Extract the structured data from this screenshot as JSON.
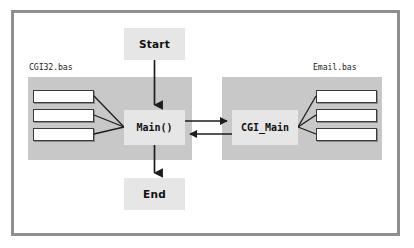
{
  "figure": {
    "type": "flow-diagram",
    "frame_border_color": "#8e8f91",
    "background_color": "#ffffff"
  },
  "modules": [
    {
      "id": "cgi32",
      "label": "CGI32.bas",
      "panel_color": "#c8c8c8",
      "routine_boxes": [
        "",
        "",
        ""
      ],
      "routine_count": 3
    },
    {
      "id": "email",
      "label": "Email.bas",
      "panel_color": "#c8c8c8",
      "routine_boxes": [
        "",
        "",
        ""
      ],
      "routine_count": 3
    }
  ],
  "nodes": [
    {
      "id": "start",
      "label": "Start",
      "shape": "terminator",
      "fill": "#e6e6e6",
      "bold": true,
      "mono": false
    },
    {
      "id": "main",
      "label": "Main()",
      "shape": "process",
      "fill": "#e6e6e6",
      "bold": true,
      "mono": true
    },
    {
      "id": "cgi_main",
      "label": "CGI_Main",
      "shape": "process",
      "fill": "#e6e6e6",
      "bold": true,
      "mono": true
    },
    {
      "id": "end",
      "label": "End",
      "shape": "terminator",
      "fill": "#e6e6e6",
      "bold": true,
      "mono": false
    }
  ],
  "connectors": [
    {
      "from": "start",
      "to": "main",
      "direction": "down",
      "arrowhead": true
    },
    {
      "from": "main",
      "to": "end",
      "direction": "down",
      "arrowhead": true
    },
    {
      "from": "main",
      "to": "cgi_main",
      "direction": "right",
      "arrowhead": true
    },
    {
      "from": "cgi_main",
      "to": "main",
      "direction": "left",
      "arrowhead": true
    },
    {
      "from": "cgi32.routine_boxes",
      "to": "main",
      "direction": "converge-right",
      "arrowhead": false
    },
    {
      "from": "email.routine_boxes",
      "to": "cgi_main",
      "direction": "converge-left",
      "arrowhead": false
    }
  ],
  "colors": {
    "line": "#1d1d1d",
    "panel": "#c8c8c8",
    "node_fill": "#e6e6e6",
    "box_border": "#3b3b3b",
    "frame": "#8e8f91",
    "text": "#111111"
  }
}
